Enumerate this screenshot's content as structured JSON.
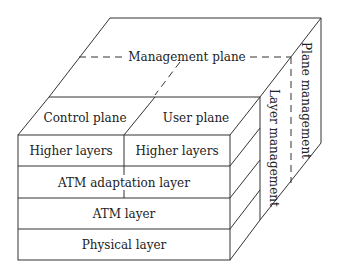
{
  "diagram": {
    "type": "B-ISDN protocol reference model cube",
    "top": {
      "management_plane": "Management plane",
      "control_plane": "Control plane",
      "user_plane": "User plane"
    },
    "front_layers": [
      {
        "left": "Higher layers",
        "right": "Higher layers"
      },
      {
        "label": "ATM adaptation layer"
      },
      {
        "label": "ATM layer"
      },
      {
        "label": "Physical layer"
      }
    ],
    "side": {
      "layer_management": "Layer management",
      "plane_management": "Plane management"
    },
    "colors": {
      "line": "#333333",
      "text": "#222222",
      "background": "#ffffff"
    }
  }
}
